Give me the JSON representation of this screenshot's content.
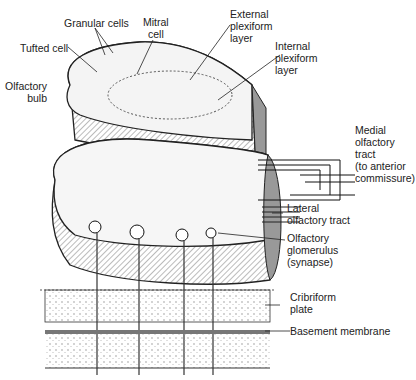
{
  "labels": {
    "granular_cells": "Granular cells",
    "mitral_cell": "Mitral\ncell",
    "tufted_cell": "Tufted cell",
    "olfactory_bulb": "Olfactory\nbulb",
    "external_plexiform": "External\nplexiform\nlayer",
    "internal_plexiform": "Internal\nplexiform\nlayer",
    "medial_tract": "Medial\nolfactory\ntract\n(to anterior\ncommissure)",
    "lateral_tract": "Lateral\nolfactory tract",
    "glomerulus": "Olfactory\nglomerulus\n(synapse)",
    "cribriform": "Cribriform\nplate",
    "basement": "Basement membrane"
  }
}
